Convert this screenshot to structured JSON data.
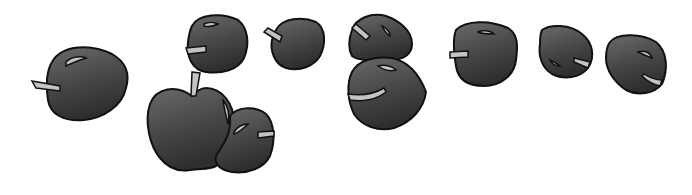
{
  "image": {
    "description": "Illustration of ten dark gray cartoon apples with light gray stems and highlights",
    "apple_count": 10,
    "colors": {
      "background": "#ffffff",
      "apple_fill_light": "#6a6a6a",
      "apple_fill_dark": "#2e2e2e",
      "outline": "#111111",
      "stem_and_highlight": "#c4c4c4"
    }
  }
}
